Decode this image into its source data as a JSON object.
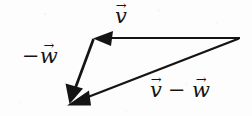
{
  "figure": {
    "name": "vector-subtraction-triangle",
    "background_color": "#fdfdfd",
    "stroke_color": "#141414",
    "width": 252,
    "height": 116
  },
  "labels": {
    "v": {
      "symbol": "v",
      "accent": "→",
      "prefix": "",
      "text": "v⃗"
    },
    "neg_w": {
      "symbol": "w",
      "accent": "→",
      "prefix": "−",
      "text": "−w⃗"
    },
    "v_minus_w": {
      "left_symbol": "v",
      "operator": "−",
      "right_symbol": "w",
      "accent": "→",
      "text": "v⃗ − w⃗"
    }
  },
  "vectors": [
    {
      "name": "vector-v",
      "label": "v⃗",
      "start": [
        240,
        38
      ],
      "end": [
        95,
        38
      ],
      "arrowhead": "end",
      "direction": "left",
      "stroke_width": 1.8
    },
    {
      "name": "vector-negative-w",
      "label": "−w⃗",
      "start": [
        93,
        39
      ],
      "end": [
        70,
        100
      ],
      "arrowhead": "end",
      "direction": "down-left",
      "stroke_width": 2.6
    },
    {
      "name": "vector-v-minus-w",
      "label": "v⃗ − w⃗",
      "start": [
        239,
        39
      ],
      "end": [
        72,
        103
      ],
      "arrowhead": "end",
      "direction": "down-left",
      "stroke_width": 2.4
    }
  ],
  "vertices": {
    "top_left": [
      93,
      38
    ],
    "right": [
      240,
      38
    ],
    "bottom_left": [
      70,
      102
    ]
  }
}
